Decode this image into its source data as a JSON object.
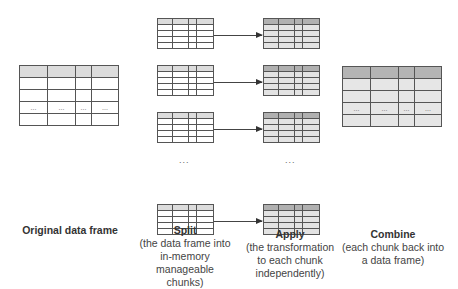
{
  "diagram": {
    "original": {
      "title": "Original data frame",
      "ellipsis_row": [
        "...",
        "...",
        "...",
        "..."
      ]
    },
    "split": {
      "title": "Split",
      "description": [
        "(the data frame into",
        "in-memory manageable",
        "chunks)"
      ],
      "ellipsis": "..."
    },
    "apply": {
      "title": "Apply",
      "description": [
        "(the transformation",
        "to each chunk",
        "independently)"
      ],
      "ellipsis": "..."
    },
    "combine": {
      "title": "Combine",
      "description": [
        "(each chunk back into",
        "a data frame)"
      ],
      "ellipsis_row": [
        "...",
        "...",
        "...",
        "..."
      ]
    },
    "colors": {
      "split_header": "#dcdcdc",
      "apply_header": "#b0b0b0",
      "apply_body": "#e3e3e3",
      "combine_header": "#b4b4b4",
      "combine_body": "#e6e6e6",
      "border": "#555555"
    }
  }
}
